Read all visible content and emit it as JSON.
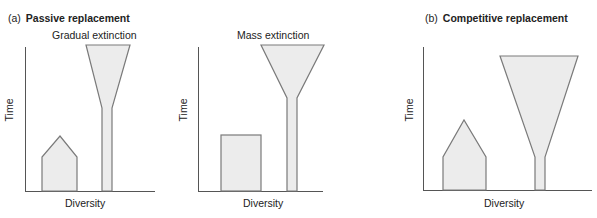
{
  "panels": {
    "a": {
      "tag": "(a)",
      "title": "Passive replacement",
      "subpanels": [
        {
          "subtitle": "Gradual extinction",
          "xlabel": "Diversity",
          "ylabel": "Time"
        },
        {
          "subtitle": "Mass extinction",
          "xlabel": "Diversity",
          "ylabel": "Time"
        }
      ]
    },
    "b": {
      "tag": "(b)",
      "title": "Competitive replacement",
      "xlabel": "Diversity",
      "ylabel": "Time"
    }
  },
  "colors": {
    "fill": "#ececec",
    "stroke": "#7a7a7a",
    "axis": "#555555"
  }
}
